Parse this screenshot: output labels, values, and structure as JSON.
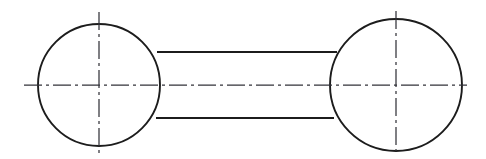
{
  "drawing": {
    "title": "Two-bore connecting rod outline",
    "description": "Engineering line drawing: two circles joined by a straight parallel-sided rod, with chain-dash centre lines",
    "canvas": {
      "width": 486,
      "height": 159,
      "background_color": "#ffffff"
    },
    "style": {
      "outline_color": "#1c1c1c",
      "outline_width": 1.9,
      "centerline_color": "#33333a",
      "centerline_width": 1.25,
      "centerline_dash": "18 4 3 4"
    },
    "shapes": {
      "left_circle": {
        "name": "left-bore-circle",
        "cx": 99,
        "cy": 85,
        "r": 61
      },
      "right_circle": {
        "name": "right-bore-circle",
        "cx": 396,
        "cy": 85,
        "r": 66
      },
      "rod_top_line": {
        "name": "rod-top-edge",
        "x1": 157,
        "y1": 52,
        "x2": 337,
        "y2": 52
      },
      "rod_bottom_line": {
        "name": "rod-bottom-edge",
        "x1": 156,
        "y1": 118,
        "x2": 334,
        "y2": 118
      }
    },
    "centerlines": {
      "horizontal": {
        "name": "horizontal-centerline",
        "x1": 24,
        "y1": 85,
        "x2": 467,
        "y2": 85
      },
      "left_vertical": {
        "name": "left-vertical-centerline",
        "x1": 99,
        "y1": 12,
        "x2": 99,
        "y2": 153
      },
      "right_vertical": {
        "name": "right-vertical-centerline",
        "x1": 396,
        "y1": 11,
        "x2": 396,
        "y2": 151
      }
    }
  }
}
